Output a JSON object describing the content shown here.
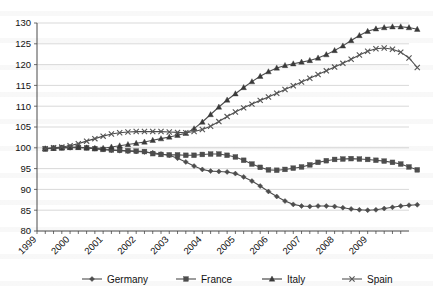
{
  "chart_data": {
    "type": "line",
    "title": "",
    "xlabel": "",
    "ylabel": "",
    "ylim": [
      80,
      130
    ],
    "ytick_values": [
      80,
      85,
      90,
      95,
      100,
      105,
      110,
      115,
      120,
      125,
      130
    ],
    "grid": true,
    "legend_position": "bottom",
    "x_tick_labels": [
      "1999",
      "2000",
      "2001",
      "2002",
      "2003",
      "2004",
      "2005",
      "2006",
      "2007",
      "2008",
      "2009"
    ],
    "x_minor_ticks_per_year": 4,
    "x": [
      "1999Q1",
      "1999Q2",
      "1999Q3",
      "1999Q4",
      "2000Q1",
      "2000Q2",
      "2000Q3",
      "2000Q4",
      "2001Q1",
      "2001Q2",
      "2001Q3",
      "2001Q4",
      "2002Q1",
      "2002Q2",
      "2002Q3",
      "2002Q4",
      "2003Q1",
      "2003Q2",
      "2003Q3",
      "2003Q4",
      "2004Q1",
      "2004Q2",
      "2004Q3",
      "2004Q4",
      "2005Q1",
      "2005Q2",
      "2005Q3",
      "2005Q4",
      "2006Q1",
      "2006Q2",
      "2006Q3",
      "2006Q4",
      "2007Q1",
      "2007Q2",
      "2007Q3",
      "2007Q4",
      "2008Q1",
      "2008Q2",
      "2008Q3",
      "2008Q4",
      "2009Q1",
      "2009Q2",
      "2009Q3",
      "2009Q4",
      "2010Q1",
      "2010Q2"
    ],
    "series": [
      {
        "name": "Germany",
        "marker": "diamond",
        "color": "#4d4d4d",
        "values": [
          99.8,
          99.9,
          100.0,
          100.0,
          100.1,
          100.0,
          99.8,
          99.6,
          99.4,
          99.3,
          99.2,
          99.1,
          99.0,
          98.8,
          98.5,
          98.2,
          97.5,
          96.6,
          95.6,
          94.8,
          94.4,
          94.3,
          94.2,
          93.8,
          93.0,
          92.0,
          90.8,
          89.5,
          88.3,
          87.2,
          86.4,
          86.0,
          85.9,
          86.0,
          86.0,
          85.9,
          85.6,
          85.3,
          85.1,
          85.0,
          85.1,
          85.4,
          85.7,
          86.0,
          86.2,
          86.3
        ]
      },
      {
        "name": "France",
        "marker": "square",
        "color": "#4d4d4d",
        "values": [
          99.7,
          99.9,
          100.0,
          100.1,
          100.1,
          100.0,
          99.8,
          99.6,
          99.5,
          99.4,
          99.3,
          99.2,
          99.1,
          98.6,
          98.4,
          98.3,
          98.3,
          98.2,
          98.2,
          98.4,
          98.5,
          98.5,
          98.2,
          97.8,
          97.0,
          96.1,
          95.3,
          94.7,
          94.6,
          94.8,
          95.1,
          95.4,
          95.9,
          96.5,
          96.9,
          97.2,
          97.3,
          97.4,
          97.3,
          97.2,
          97.0,
          96.8,
          96.5,
          96.1,
          95.4,
          94.7
        ]
      },
      {
        "name": "Italy",
        "marker": "triangle",
        "color": "#3a3a3a",
        "values": [
          99.8,
          99.9,
          100.0,
          100.1,
          100.1,
          100.0,
          99.9,
          99.9,
          100.2,
          100.5,
          100.8,
          101.1,
          101.4,
          101.8,
          102.2,
          102.6,
          103.0,
          103.5,
          104.6,
          106.2,
          108.0,
          109.8,
          111.5,
          113.0,
          114.5,
          115.9,
          117.2,
          118.3,
          119.2,
          119.8,
          120.2,
          120.6,
          121.0,
          121.6,
          122.4,
          123.4,
          124.5,
          125.8,
          127.0,
          128.0,
          128.6,
          128.9,
          129.1,
          129.1,
          128.9,
          128.5
        ]
      },
      {
        "name": "Spain",
        "marker": "x",
        "color": "#555555",
        "values": [
          99.8,
          100.0,
          100.2,
          100.5,
          101.0,
          101.6,
          102.2,
          102.8,
          103.3,
          103.6,
          103.8,
          103.9,
          103.9,
          103.9,
          103.9,
          103.8,
          103.7,
          103.6,
          103.9,
          104.4,
          105.2,
          106.3,
          107.5,
          108.6,
          109.6,
          110.5,
          111.4,
          112.2,
          113.1,
          114.0,
          114.9,
          115.8,
          116.7,
          117.6,
          118.5,
          119.4,
          120.3,
          121.3,
          122.3,
          123.2,
          123.8,
          124.0,
          123.7,
          123.0,
          121.6,
          119.3
        ]
      }
    ]
  },
  "legend": {
    "items": [
      {
        "label": "Germany"
      },
      {
        "label": "France"
      },
      {
        "label": "Italy"
      },
      {
        "label": "Spain"
      }
    ]
  }
}
